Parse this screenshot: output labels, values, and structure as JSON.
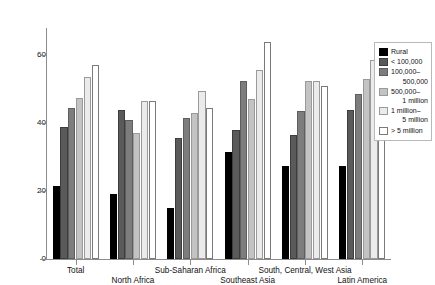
{
  "chart_data": {
    "type": "bar",
    "title": "",
    "xlabel": "",
    "ylabel": "Percentage Births Attended",
    "ylim": [
      0,
      68
    ],
    "yticks": [
      0,
      20,
      40,
      60
    ],
    "ytick_labels": [
      "0",
      "20",
      "40",
      "60"
    ],
    "grid": false,
    "legend_position": "right",
    "categories": [
      "Total",
      "North Africa",
      "Sub-Saharan Africa",
      "Southeast Asia",
      "South, Central, West Asia",
      "Latin America"
    ],
    "series": [
      {
        "name": "Rural",
        "color": "#000000",
        "border": "#000000",
        "values": [
          21.5,
          19.0,
          15.0,
          31.5,
          27.5,
          27.5
        ]
      },
      {
        "name": "< 100,000",
        "color": "#5a5a5a",
        "border": "#3d3d3d",
        "values": [
          39.0,
          44.0,
          35.5,
          38.0,
          36.5,
          44.0
        ]
      },
      {
        "name": "100,000–\n500,000",
        "color": "#7d7d7d",
        "border": "#5e5e5e",
        "values": [
          44.5,
          41.0,
          41.5,
          52.5,
          43.5,
          48.5
        ]
      },
      {
        "name": "500,000–\n1 million",
        "color": "#c3c3c3",
        "border": "#9a9a9a",
        "values": [
          47.5,
          37.0,
          43.0,
          47.0,
          52.5,
          53.0
        ]
      },
      {
        "name": "1 million–\n5 million",
        "color": "#ebebeb",
        "border": "#9a9a9a",
        "values": [
          53.5,
          46.5,
          49.5,
          55.5,
          52.5,
          58.5
        ]
      },
      {
        "name": "> 5 million",
        "color": "#ffffff",
        "border": "#7a7a7a",
        "values": [
          57.0,
          46.5,
          44.5,
          64.0,
          51.0,
          62.5
        ]
      }
    ],
    "legend_entries": [
      {
        "label": "Rural",
        "indent_label": ""
      },
      {
        "label": "< 100,000",
        "indent_label": ""
      },
      {
        "label": "100,000–",
        "indent_label": "500,000"
      },
      {
        "label": "500,000–",
        "indent_label": "1 million"
      },
      {
        "label": "1 million–",
        "indent_label": "5 million"
      },
      {
        "label": "> 5 million",
        "indent_label": ""
      }
    ],
    "xlabel_rows": [
      0,
      1,
      0,
      1,
      0,
      1
    ]
  }
}
